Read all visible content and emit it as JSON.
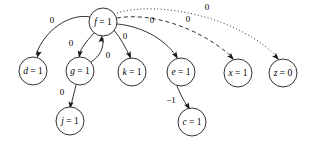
{
  "diagram": {
    "type": "directed-graph",
    "title": "",
    "background_color": "#ffffff",
    "stroke_color": "#1a1a1a",
    "width": 311,
    "height": 142,
    "nodes": [
      {
        "id": "f",
        "label": "f = 1",
        "var": "f",
        "value": "1",
        "cx": 103,
        "cy": 22,
        "r": 14
      },
      {
        "id": "d",
        "label": "d = 1",
        "var": "d",
        "value": "1",
        "cx": 33,
        "cy": 71,
        "r": 14
      },
      {
        "id": "g",
        "label": "g = 1",
        "var": "g",
        "value": "1",
        "cx": 80,
        "cy": 71,
        "r": 14
      },
      {
        "id": "k",
        "label": "k = 1",
        "var": "k",
        "value": "1",
        "cx": 132,
        "cy": 72,
        "r": 14
      },
      {
        "id": "e",
        "label": "e = 1",
        "var": "e",
        "value": "1",
        "cx": 181,
        "cy": 72,
        "r": 14
      },
      {
        "id": "x",
        "label": "x = 1",
        "var": "x",
        "value": "1",
        "cx": 238,
        "cy": 73,
        "r": 14
      },
      {
        "id": "z",
        "label": "z = 0",
        "var": "z",
        "value": "0",
        "cx": 283,
        "cy": 73,
        "r": 14
      },
      {
        "id": "j",
        "label": "j = 1",
        "var": "j",
        "value": "1",
        "cx": 70,
        "cy": 121,
        "r": 14
      },
      {
        "id": "c",
        "label": "c = 1",
        "var": "c",
        "value": "1",
        "cx": 192,
        "cy": 122,
        "r": 14
      }
    ],
    "edges": [
      {
        "id": "f-d",
        "from": "f",
        "to": "d",
        "label": "0",
        "style": "solid",
        "path": "M 90 17 C 70 13, 44 30, 36 55",
        "label_x": 52,
        "label_y": 21,
        "arrow_x": 37,
        "arrow_y": 58,
        "arrow_angle": 108
      },
      {
        "id": "f-g",
        "from": "f",
        "to": "g",
        "label": "0",
        "style": "solid",
        "path": "M 94 33 C 86 42, 81 48, 79 55",
        "label_x": 71,
        "label_y": 44,
        "arrow_x": 79,
        "arrow_y": 58,
        "arrow_angle": 100
      },
      {
        "id": "g-f",
        "from": "g",
        "to": "f",
        "label": "0",
        "style": "solid",
        "path": "M 91 62 C 100 56, 104 48, 103 38",
        "label_x": 108,
        "label_y": 56,
        "arrow_x": 102,
        "arrow_y": 35,
        "arrow_angle": -83
      },
      {
        "id": "g-j",
        "from": "g",
        "to": "j",
        "label": "0",
        "style": "solid",
        "path": "M 76 85 C 74 94, 72 100, 71 106",
        "label_x": 62,
        "label_y": 93,
        "arrow_x": 70,
        "arrow_y": 109,
        "arrow_angle": 98
      },
      {
        "id": "f-k",
        "from": "f",
        "to": "k",
        "label": "0",
        "style": "solid",
        "path": "M 114 30 C 121 39, 126 48, 130 57",
        "label_x": 125,
        "label_y": 37,
        "arrow_x": 131,
        "arrow_y": 59,
        "arrow_angle": 68
      },
      {
        "id": "f-e",
        "from": "f",
        "to": "e",
        "label": "0",
        "style": "solid",
        "path": "M 117 24 C 140 26, 164 38, 176 56",
        "label_x": 152,
        "label_y": 21,
        "arrow_x": 178,
        "arrow_y": 59,
        "arrow_angle": 58
      },
      {
        "id": "e-c",
        "from": "e",
        "to": "c",
        "label": "−1",
        "style": "solid",
        "path": "M 177 86 C 181 96, 185 103, 189 108",
        "label_x": 171,
        "label_y": 101,
        "arrow_x": 190,
        "arrow_y": 110,
        "arrow_angle": 60
      },
      {
        "id": "f-x",
        "from": "f",
        "to": "x",
        "label": "0",
        "style": "dashed",
        "path": "M 117 18 C 152 12, 200 28, 232 57",
        "label_x": 188,
        "label_y": 20,
        "arrow_x": 234,
        "arrow_y": 60,
        "arrow_angle": 48
      },
      {
        "id": "f-z",
        "from": "f",
        "to": "z",
        "label": "0",
        "style": "dotted",
        "path": "M 117 13 C 160 0, 240 18, 277 57",
        "label_x": 207,
        "label_y": 8,
        "arrow_x": 279,
        "arrow_y": 60,
        "arrow_angle": 48
      }
    ]
  }
}
